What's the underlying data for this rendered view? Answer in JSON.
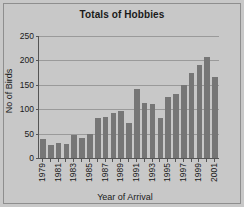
{
  "chart_data": {
    "type": "bar",
    "title": "Totals of Hobbies",
    "xlabel": "Year of Arrival",
    "ylabel": "No of Birds",
    "categories": [
      "1979",
      "1980",
      "1981",
      "1982",
      "1983",
      "1984",
      "1985",
      "1986",
      "1987",
      "1988",
      "1989",
      "1990",
      "1991",
      "1992",
      "1993",
      "1994",
      "1995",
      "1996",
      "1997",
      "1998",
      "1999",
      "2000",
      "2001"
    ],
    "values": [
      38,
      26,
      31,
      28,
      47,
      42,
      50,
      82,
      85,
      92,
      97,
      72,
      142,
      112,
      110,
      82,
      125,
      131,
      149,
      175,
      190,
      207,
      166
    ],
    "ylim": [
      0,
      250
    ],
    "ytick_labels": [
      "0",
      "50",
      "100",
      "150",
      "200",
      "250"
    ],
    "ytick_values": [
      0,
      50,
      100,
      150,
      200,
      250
    ],
    "xtick_labels": [
      "1979",
      "1981",
      "1983",
      "1985",
      "1987",
      "1989",
      "1991",
      "1993",
      "1995",
      "1997",
      "1999",
      "2001"
    ],
    "xtick_label_interval": 2,
    "grid": true,
    "legend": "none",
    "bar_color": "#767676",
    "plot_background": "#c8c8c8",
    "grid_color": "#9a9a9a",
    "axis_color": "#555555"
  }
}
